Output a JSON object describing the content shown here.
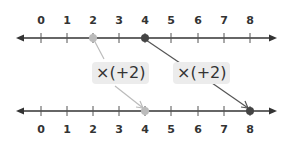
{
  "top_line": {
    "ticks": [
      "0",
      "1",
      "2",
      "3",
      "4",
      "5",
      "6",
      "7",
      "8"
    ],
    "points": [
      {
        "value": 2,
        "color": "#bbbbbb"
      },
      {
        "value": 4,
        "color": "#444444"
      }
    ]
  },
  "bottom_line": {
    "ticks": [
      "0",
      "1",
      "2",
      "3",
      "4",
      "5",
      "6",
      "7",
      "8"
    ],
    "points": [
      {
        "value": 4,
        "color": "#bbbbbb"
      },
      {
        "value": 8,
        "color": "#444444"
      }
    ]
  },
  "operations": [
    {
      "label": "×(+2)",
      "from": 2,
      "to": 4,
      "arrow_color": "#bbbbbb"
    },
    {
      "label": "×(+2)",
      "from": 4,
      "to": 8,
      "arrow_color": "#444444"
    }
  ],
  "colors": {
    "line": "#333333",
    "light_point": "#bbbbbb",
    "dark_point": "#444444",
    "op_box_bg": "#ececec"
  }
}
